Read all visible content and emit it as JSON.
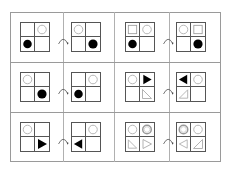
{
  "puzzle": {
    "description": "Grid of six transformation pairs, each showing a 2x2 grid before and after a transformation (curved arrow).",
    "colors": {
      "frame": "#9a9a9a",
      "grid": "#555555",
      "fill": "#000000",
      "outline": "#aaaaaa"
    },
    "arrow_icon": "curved-arrow-icon",
    "pairs": [
      {
        "before": {
          "tl": "",
          "tr": "circle-outline",
          "bl": "circle-filled",
          "br": ""
        },
        "after": {
          "tl": "circle-outline",
          "tr": "",
          "bl": "",
          "br": "circle-filled"
        }
      },
      {
        "before": {
          "tl": "square-outline",
          "tr": "circle-outline",
          "bl": "circle-filled",
          "br": ""
        },
        "after": {
          "tl": "circle-outline",
          "tr": "square-outline",
          "bl": "",
          "br": "circle-filled"
        }
      },
      {
        "before": {
          "tl": "circle-outline",
          "tr": "",
          "bl": "",
          "br": "circle-filled"
        },
        "after": {
          "tl": "",
          "tr": "circle-outline",
          "bl": "circle-filled",
          "br": ""
        }
      },
      {
        "before": {
          "tl": "circle-outline",
          "tr": "triangle-right-filled",
          "bl": "",
          "br": "right-triangle-outline"
        },
        "after": {
          "tl": "triangle-left-filled",
          "tr": "circle-outline",
          "bl": "right-triangle-outline-mirrored",
          "br": ""
        }
      },
      {
        "before": {
          "tl": "circle-outline",
          "tr": "",
          "bl": "",
          "br": "triangle-right-filled"
        },
        "after": {
          "tl": "",
          "tr": "circle-outline",
          "bl": "triangle-left-filled",
          "br": ""
        }
      },
      {
        "before": {
          "tl": "circle-outline",
          "tr": "circle-double",
          "bl": "right-triangle-outline",
          "br": "triangle-right-outline"
        },
        "after": {
          "tl": "circle-double",
          "tr": "circle-outline",
          "bl": "triangle-left-outline",
          "br": "right-triangle-outline-mirrored"
        }
      }
    ]
  }
}
